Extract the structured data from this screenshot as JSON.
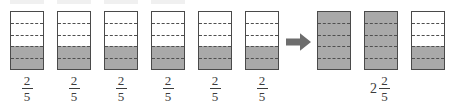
{
  "diagram": {
    "type": "fraction-bar-model",
    "partitions_per_bar": 5,
    "shading_color": "#a9a9a9",
    "outline_color": "#4a4a4a",
    "divider_color": "#4f4f4f",
    "background_color": "#ffffff"
  },
  "operands": {
    "count": 6,
    "bars": [
      {
        "shaded_parts": 2,
        "total_parts": 5,
        "label": {
          "whole": "",
          "numerator": "2",
          "denominator": "5"
        }
      },
      {
        "shaded_parts": 2,
        "total_parts": 5,
        "label": {
          "whole": "",
          "numerator": "2",
          "denominator": "5"
        }
      },
      {
        "shaded_parts": 2,
        "total_parts": 5,
        "label": {
          "whole": "",
          "numerator": "2",
          "denominator": "5"
        }
      },
      {
        "shaded_parts": 2,
        "total_parts": 5,
        "label": {
          "whole": "",
          "numerator": "2",
          "denominator": "5"
        }
      },
      {
        "shaded_parts": 2,
        "total_parts": 5,
        "label": {
          "whole": "",
          "numerator": "2",
          "denominator": "5"
        }
      },
      {
        "shaded_parts": 2,
        "total_parts": 5,
        "label": {
          "whole": "",
          "numerator": "2",
          "denominator": "5"
        }
      }
    ]
  },
  "operator": {
    "symbol": "right-arrow",
    "name": "arrow-right-icon"
  },
  "result": {
    "count": 3,
    "bars": [
      {
        "shaded_parts": 5,
        "total_parts": 5
      },
      {
        "shaded_parts": 5,
        "total_parts": 5
      },
      {
        "shaded_parts": 2,
        "total_parts": 5
      }
    ],
    "label": {
      "whole": "2",
      "numerator": "2",
      "denominator": "5"
    }
  }
}
